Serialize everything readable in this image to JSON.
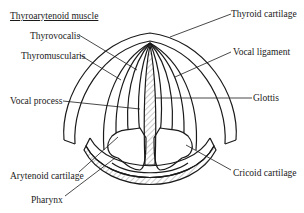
{
  "diagram": {
    "title": "Thyroarytenoid muscle",
    "labels": {
      "thyrovocalis": "Thyrovocalis",
      "thyromuscularis": "Thyromuscularis",
      "vocal_process": "Vocal process",
      "thyroid_cartilage": "Thyroid cartilage",
      "vocal_ligament": "Vocal ligament",
      "glottis": "Glottis",
      "arytenoid_cartilage": "Arytenoid cartilage",
      "cricoid_cartilage": "Cricoid cartilage",
      "pharynx": "Pharynx"
    }
  }
}
